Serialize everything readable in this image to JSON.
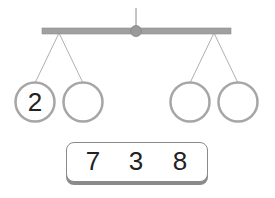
{
  "balance": {
    "left_pans": [
      {
        "value": "2"
      },
      {
        "value": ""
      }
    ],
    "right_pans": [
      {
        "value": ""
      },
      {
        "value": ""
      }
    ]
  },
  "number_bank": {
    "numbers": [
      "7",
      "3",
      "8"
    ]
  },
  "colors": {
    "beam": "#9a9a9a",
    "pan_border": "#a6a6a6",
    "string": "#9a9a9a",
    "text": "#222222"
  }
}
